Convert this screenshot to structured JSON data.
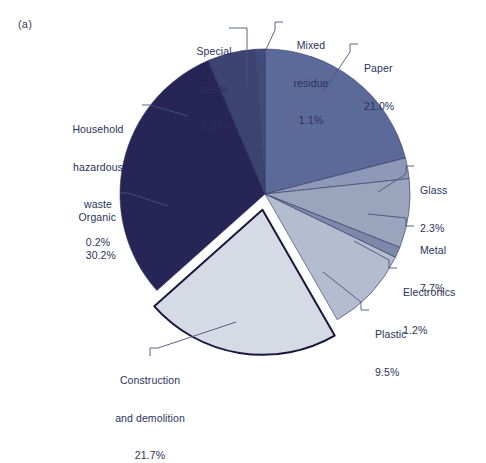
{
  "figure": {
    "panel_tag": "(a)",
    "background": "#ffffff",
    "text_color": "#2b325c",
    "leader_color": "#4a5278"
  },
  "chart_data": {
    "type": "pie",
    "title": "",
    "xlabel": "",
    "ylabel": "",
    "units": "percent",
    "start_angle_deg": 0,
    "direction": "clockwise",
    "legend": "none",
    "grid": false,
    "center_px": [
      265,
      194
    ],
    "radius_px": 145,
    "categories": [
      "Paper",
      "Glass",
      "Metal",
      "Electronics",
      "Plastic",
      "Construction and demolition",
      "Organic",
      "Household hazardous waste",
      "Special waste",
      "Mixed residue"
    ],
    "values": [
      21.0,
      2.3,
      7.7,
      1.2,
      9.5,
      21.7,
      30.2,
      0.2,
      5.1,
      1.1
    ],
    "value_labels": [
      "21.0%",
      "2.3%",
      "7.7%",
      "1.2%",
      "9.5%",
      "21.7%",
      "30.2%",
      "0.2%",
      "5.1%",
      "1.1%"
    ],
    "colors": [
      "#5b6a99",
      "#8e99b7",
      "#9aa5bd",
      "#7d88ab",
      "#b4bccf",
      "#d6dae4",
      "#262556",
      "#3a4070",
      "#3d4472",
      "#424a79"
    ],
    "exploded": [
      "Construction and demolition"
    ],
    "slices": [
      {
        "name": "Paper",
        "value": 21.0,
        "label": "Paper",
        "value_label": "21.0%",
        "color": "#5b6a99"
      },
      {
        "name": "Glass",
        "value": 2.3,
        "label": "Glass",
        "value_label": "2.3%",
        "color": "#8e99b7"
      },
      {
        "name": "Metal",
        "value": 7.7,
        "label": "Metal",
        "value_label": "7.7%",
        "color": "#9aa5bd"
      },
      {
        "name": "Electronics",
        "value": 1.2,
        "label": "Electronics",
        "value_label": "1.2%",
        "color": "#7d88ab"
      },
      {
        "name": "Plastic",
        "value": 9.5,
        "label": "Plastic",
        "value_label": "9.5%",
        "color": "#b4bccf"
      },
      {
        "name": "Construction and demolition",
        "value": 21.7,
        "label": "Construction and demolition",
        "value_label": "21.7%",
        "color": "#d6dae4"
      },
      {
        "name": "Organic",
        "value": 30.2,
        "label": "Organic",
        "value_label": "30.2%",
        "color": "#262556"
      },
      {
        "name": "Household hazardous waste",
        "value": 0.2,
        "label": "Household hazardous waste",
        "value_label": "0.2%",
        "color": "#3a4070"
      },
      {
        "name": "Special waste",
        "value": 5.1,
        "label": "Special waste",
        "value_label": "5.1%",
        "color": "#3d4472"
      },
      {
        "name": "Mixed residue",
        "value": 1.1,
        "label": "Mixed residue",
        "value_label": "1.1%",
        "color": "#424a79"
      }
    ]
  },
  "labels": {
    "special_waste": {
      "line1": "Special",
      "line2": "waste",
      "line3": "5.1%"
    },
    "mixed_residue": {
      "line1": "Mixed",
      "line2": "residue",
      "line3": "1.1%"
    },
    "paper": {
      "line1": "Paper",
      "line2": "21.0%"
    },
    "glass": {
      "line1": "Glass",
      "line2": "2.3%"
    },
    "metal": {
      "line1": "Metal",
      "line2": "7.7%"
    },
    "electronics": {
      "line1": "Electronics",
      "line2": "1.2%"
    },
    "plastic": {
      "line1": "Plastic",
      "line2": "9.5%"
    },
    "construction": {
      "line1": "Construction",
      "line2": "and demolition",
      "line3": "21.7%"
    },
    "organic": {
      "line1": "Organic",
      "line2": "30.2%"
    },
    "household": {
      "line1": "Household",
      "line2": "hazardous",
      "line3": "waste",
      "line4": "0.2%"
    }
  }
}
